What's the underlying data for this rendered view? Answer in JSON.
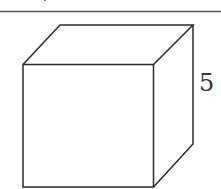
{
  "figure": {
    "type": "cube",
    "edge_label": "5",
    "top_fragment": ".",
    "colors": {
      "stroke": "#2a2a2a",
      "divider": "#555555",
      "background": "#ffffff"
    }
  }
}
